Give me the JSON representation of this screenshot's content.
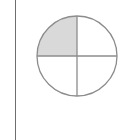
{
  "diagram": {
    "type": "fraction-circle",
    "parts": 4,
    "shaded_parts": 1,
    "shaded_quadrant": "top-left",
    "fraction": "1/4",
    "circle": {
      "cx": 77,
      "cy": 56,
      "r": 40
    },
    "colors": {
      "stroke": "#8c8c8c",
      "shaded_fill": "#d9d9d9",
      "unshaded_fill": "#ffffff",
      "left_border": "#6e6e6e"
    }
  }
}
